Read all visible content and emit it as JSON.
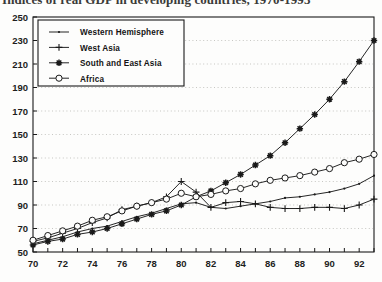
{
  "figure": {
    "title": "Indices of real GDP in developing countries, 1970-1993",
    "footer_noise": "· — ·· —  ···  — ·· ———  ·· —  ··· — · —— ·· —",
    "axis_color": "#1a1a1a",
    "grid_color": "#b9b9b4",
    "background": "#fdfdfc"
  },
  "legend": {
    "position": "top-left-inside",
    "items": [
      {
        "label": "Western Hemisphere",
        "marker": "dot-small",
        "marker_icon": "small-dot-marker-icon"
      },
      {
        "label": "West Asia",
        "marker": "plus",
        "marker_icon": "plus-marker-icon"
      },
      {
        "label": "South and East Asia",
        "marker": "star",
        "marker_icon": "star-marker-icon"
      },
      {
        "label": "Africa",
        "marker": "open-circle",
        "marker_icon": "open-circle-marker-icon"
      }
    ]
  },
  "chart_data": {
    "type": "line",
    "title": "Indices of real GDP in developing countries, 1970-1993",
    "xlabel": "",
    "ylabel": "",
    "xlim": [
      70,
      93
    ],
    "ylim": [
      50,
      250
    ],
    "ytick_step": 20,
    "xtick_step": 1,
    "xtick_label_step": 2,
    "grid": true,
    "grid_axis": "y",
    "legend_position": "upper left",
    "yticks": [
      50,
      70,
      90,
      110,
      130,
      150,
      170,
      190,
      210,
      230,
      250
    ],
    "ytick_labels": [
      "50",
      "70",
      "90",
      "110",
      "130",
      "150",
      "170",
      "190",
      "210",
      "230",
      "250"
    ],
    "x": [
      70,
      71,
      72,
      73,
      74,
      75,
      76,
      77,
      78,
      79,
      80,
      81,
      82,
      83,
      84,
      85,
      86,
      87,
      88,
      89,
      90,
      91,
      92,
      93
    ],
    "xtick_labels": [
      "70",
      "",
      "72",
      "",
      "74",
      "",
      "76",
      "",
      "78",
      "",
      "80",
      "",
      "82",
      "",
      "84",
      "",
      "86",
      "",
      "88",
      "",
      "90",
      "",
      "92",
      ""
    ],
    "series": [
      {
        "name": "Western Hemisphere",
        "marker": "dot-small",
        "values": [
          57,
          60,
          63,
          67,
          70,
          72,
          76,
          80,
          83,
          87,
          91,
          92,
          88,
          87,
          89,
          91,
          93,
          96,
          97,
          99,
          101,
          104,
          108,
          115
        ]
      },
      {
        "name": "West Asia",
        "marker": "plus",
        "values": [
          59,
          62,
          66,
          70,
          75,
          79,
          86,
          89,
          92,
          97,
          110,
          101,
          88,
          92,
          93,
          91,
          88,
          87,
          87,
          88,
          88,
          87,
          90,
          95
        ]
      },
      {
        "name": "South and East Asia",
        "marker": "star",
        "values": [
          56,
          59,
          61,
          65,
          67,
          70,
          74,
          78,
          82,
          85,
          90,
          97,
          102,
          109,
          116,
          124,
          132,
          143,
          155,
          167,
          180,
          195,
          212,
          230
        ]
      },
      {
        "name": "Africa",
        "marker": "open-circle",
        "values": [
          60,
          64,
          68,
          72,
          77,
          80,
          85,
          89,
          92,
          95,
          100,
          97,
          99,
          102,
          104,
          108,
          111,
          113,
          115,
          118,
          121,
          126,
          129,
          133
        ]
      }
    ]
  }
}
